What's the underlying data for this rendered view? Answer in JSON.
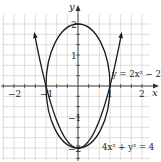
{
  "chart_data": {
    "type": "line",
    "title": "",
    "xlabel": "x",
    "ylabel": "y",
    "xlim": [
      -2.4,
      2.6
    ],
    "ylim": [
      -2.2,
      2.4
    ],
    "grid": true,
    "grid_step": 0.3333,
    "x_ticks": [
      -2,
      -1,
      1,
      2
    ],
    "x_tick_labels": [
      "−2",
      "−1",
      "1",
      "2"
    ],
    "y_ticks": [
      2,
      1,
      -1,
      -2
    ],
    "y_tick_labels": [
      "2",
      "1",
      "−1",
      "−2"
    ],
    "series": [
      {
        "name": "y = 2x² − 2",
        "equation": "y = 2x^2 - 2",
        "kind": "parabola",
        "x_range": [
          -1.35,
          1.35
        ],
        "arrows": true
      },
      {
        "name": "4x² + y² = 4",
        "equation": "4x^2 + y^2 = 4",
        "kind": "ellipse",
        "semi_axis_x": 1,
        "semi_axis_y": 2
      }
    ],
    "intersections": [
      [
        -1,
        0
      ],
      [
        1,
        0
      ],
      [
        0,
        -2
      ]
    ],
    "annotations": [
      {
        "text": "y = 2x² − 2",
        "x": 1.25,
        "y": 0.4
      },
      {
        "text": "4x² + y² = 4",
        "x": 0.55,
        "y": -1.85
      }
    ]
  },
  "labels": {
    "x_axis": "x",
    "y_axis": "y",
    "parabola_eq": "y = 2x² − 2",
    "ellipse_eq": "4x² + y² = 4"
  },
  "colors": {
    "curve": "#1a1a1a",
    "grid": "#c8c8c8",
    "axis": "#333333",
    "background": "#ffffff"
  }
}
